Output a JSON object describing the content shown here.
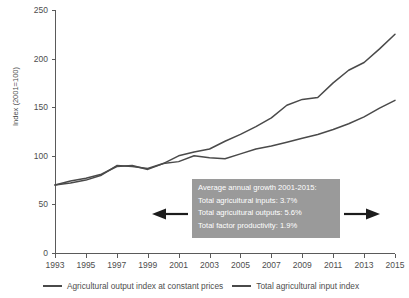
{
  "chart_data": {
    "type": "line",
    "title": "",
    "xlabel": "",
    "ylabel": "Index (2001=100)",
    "xlim": [
      1993,
      2015
    ],
    "ylim": [
      0,
      250
    ],
    "grid": false,
    "legend_position": "bottom",
    "x": [
      1993,
      1994,
      1995,
      1996,
      1997,
      1998,
      1999,
      2000,
      2001,
      2002,
      2003,
      2004,
      2005,
      2006,
      2007,
      2008,
      2009,
      2010,
      2011,
      2012,
      2013,
      2014,
      2015
    ],
    "y_ticks": [
      0,
      50,
      100,
      150,
      200,
      250
    ],
    "x_ticks": [
      1993,
      1995,
      1997,
      1999,
      2001,
      2003,
      2005,
      2007,
      2009,
      2011,
      2013,
      2015
    ],
    "series": [
      {
        "name": "Agricultural output index at constant prices",
        "color": "#4a4a4a",
        "values": [
          70,
          72,
          75,
          80,
          90,
          89,
          87,
          92,
          100,
          104,
          107,
          115,
          122,
          130,
          139,
          152,
          158,
          160,
          175,
          188,
          196,
          210,
          225
        ]
      },
      {
        "name": "Total agricultural input index",
        "color": "#4a4a4a",
        "values": [
          70,
          74,
          77,
          81,
          89,
          90,
          86,
          92,
          94,
          100,
          98,
          97,
          102,
          107,
          110,
          114,
          118,
          122,
          127,
          133,
          140,
          149,
          157
        ]
      }
    ],
    "annotation": {
      "title": "Average annual growth 2001-2015:",
      "lines": [
        "Total agricultural inputs: 3.7%",
        "Total agricultural outputs: 5.6%",
        "Total factor productivity: 1.9%"
      ],
      "background": "#9a9a9a",
      "text_color": "#ffffff"
    },
    "arrows": [
      {
        "name": "left-arrow",
        "direction": "left"
      },
      {
        "name": "right-arrow",
        "direction": "right"
      }
    ]
  }
}
